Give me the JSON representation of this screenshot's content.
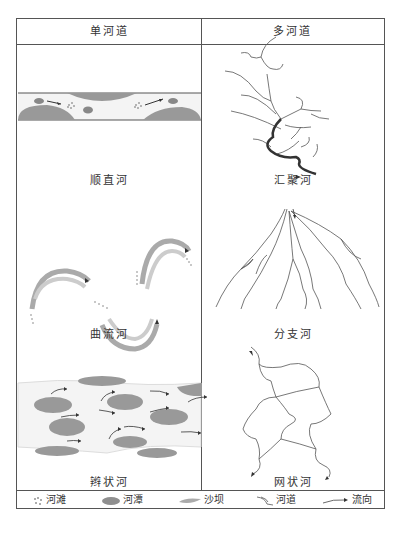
{
  "header": {
    "left": "单河道",
    "right": "多河道"
  },
  "panels": [
    {
      "id": "straight",
      "label": "顺直河",
      "column": "单河道"
    },
    {
      "id": "meandering",
      "label": "曲流河",
      "column": "单河道"
    },
    {
      "id": "braided",
      "label": "辫状河",
      "column": "单河道"
    },
    {
      "id": "converging",
      "label": "汇聚河",
      "column": "多河道"
    },
    {
      "id": "distributary",
      "label": "分支河",
      "column": "多河道"
    },
    {
      "id": "anastomosing",
      "label": "网状河",
      "column": "多河道"
    }
  ],
  "legend": [
    {
      "symbol": "dotted-cluster",
      "label": "河滩"
    },
    {
      "symbol": "dark-gray-ellipse",
      "label": "河潭"
    },
    {
      "symbol": "light-gray-lens",
      "label": "沙坝"
    },
    {
      "symbol": "channel-lines",
      "label": "河道"
    },
    {
      "symbol": "arrow",
      "label": "流向"
    }
  ],
  "colors": {
    "border": "#555555",
    "bar_fill": "#9a9a9a",
    "pool_fill": "#8f8f8f",
    "channel_fill": "#f4f4f4",
    "line": "#444444"
  }
}
